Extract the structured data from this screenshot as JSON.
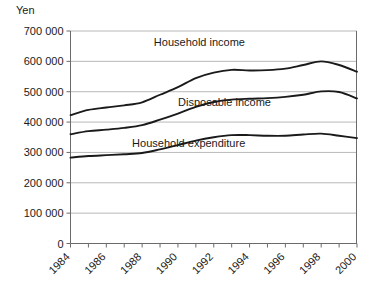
{
  "chart_data": {
    "type": "line",
    "title": "",
    "unit_label": "Yen",
    "xlabel": "",
    "ylabel": "",
    "grid": true,
    "legend_position": "inline-annotations",
    "ylim": [
      0,
      700000
    ],
    "yticks": [
      0,
      100000,
      200000,
      300000,
      400000,
      500000,
      600000,
      700000
    ],
    "ytick_labels": [
      "0",
      "100 000",
      "200 000",
      "300 000",
      "400 000",
      "500 000",
      "600 000",
      "700 000"
    ],
    "x": [
      1984,
      1985,
      1986,
      1987,
      1988,
      1989,
      1990,
      1991,
      1992,
      1993,
      1994,
      1995,
      1996,
      1997,
      1998,
      1999,
      2000
    ],
    "xtick_labels": [
      "1984",
      "1986",
      "1988",
      "1990",
      "1992",
      "1994",
      "1996",
      "1998",
      "2000"
    ],
    "xtick_values": [
      1984,
      1986,
      1988,
      1990,
      1992,
      1994,
      1996,
      1998,
      2000
    ],
    "xlim": [
      1984,
      2000
    ],
    "series": [
      {
        "name": "Household income",
        "label": "Household income",
        "color": "#1a1a1a",
        "values": [
          423000,
          440000,
          448000,
          455000,
          465000,
          490000,
          515000,
          545000,
          563000,
          572000,
          570000,
          571000,
          576000,
          588000,
          600000,
          588000,
          566000
        ]
      },
      {
        "name": "Disposable income",
        "label": "Disposable income",
        "color": "#1a1a1a",
        "values": [
          360000,
          370000,
          375000,
          381000,
          390000,
          408000,
          428000,
          450000,
          466000,
          474000,
          477000,
          479000,
          483000,
          490000,
          501000,
          499000,
          478000
        ]
      },
      {
        "name": "Household expenditure",
        "label": "Household expenditure",
        "color": "#1a1a1a",
        "values": [
          283000,
          288000,
          291000,
          294000,
          298000,
          310000,
          324000,
          339000,
          350000,
          357000,
          357000,
          355000,
          355000,
          359000,
          362000,
          355000,
          347000
        ]
      }
    ],
    "annotations": [
      {
        "text": "Household income",
        "x": 1991.2,
        "y": 652000
      },
      {
        "text": "Disposable income",
        "x": 1992.6,
        "y": 453000
      },
      {
        "text": "Household expenditure",
        "x": 1990.6,
        "y": 318000
      }
    ]
  }
}
